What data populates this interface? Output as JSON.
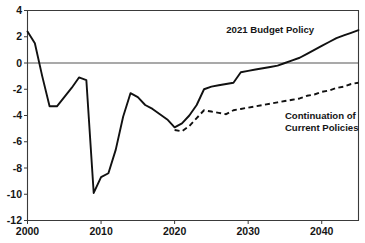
{
  "figure": {
    "partial_top_text": "",
    "background_color": "#ffffff",
    "line_color": "#111111"
  },
  "chart_data": {
    "type": "line",
    "title": "",
    "xlabel": "",
    "ylabel": "",
    "xlim": [
      2000,
      2045
    ],
    "ylim": [
      -12,
      4
    ],
    "yticks": [
      4,
      2,
      0,
      -2,
      -4,
      -6,
      -8,
      -10,
      -12
    ],
    "ytick_labels": [
      "4",
      "2",
      "0",
      "-2",
      "-4",
      "-6",
      "-8",
      "-10",
      "-12"
    ],
    "xticks": [
      2000,
      2010,
      2020,
      2030,
      2040
    ],
    "xtick_labels": [
      "2000",
      "2010",
      "2020",
      "2030",
      "2040"
    ],
    "grid": false,
    "legend_position": "inline-annotations",
    "zero_line": 0,
    "annotations": [
      {
        "text": "2021 Budget Policy",
        "x": 2033,
        "y": 2.3,
        "anchor": "middle"
      },
      {
        "text": "Continuation of",
        "x": 2035,
        "y": -4.3,
        "anchor": "start"
      },
      {
        "text": "Current Policies",
        "x": 2035,
        "y": -5.2,
        "anchor": "start"
      }
    ],
    "series": [
      {
        "name": "2021 Budget Policy",
        "style": "solid",
        "x": [
          2000,
          2001,
          2002,
          2003,
          2004,
          2005,
          2006,
          2007,
          2008,
          2009,
          2010,
          2011,
          2012,
          2013,
          2014,
          2015,
          2016,
          2017,
          2018,
          2019,
          2020,
          2021,
          2022,
          2023,
          2024,
          2025,
          2026,
          2027,
          2028,
          2029,
          2030,
          2031,
          2032,
          2033,
          2034,
          2035,
          2036,
          2037,
          2038,
          2039,
          2040,
          2041,
          2042,
          2043,
          2044,
          2045
        ],
        "values": [
          2.4,
          1.5,
          -1.0,
          -3.3,
          -3.3,
          -2.6,
          -1.9,
          -1.1,
          -1.3,
          -9.9,
          -8.7,
          -8.4,
          -6.6,
          -4.1,
          -2.3,
          -2.6,
          -3.2,
          -3.5,
          -3.9,
          -4.3,
          -4.9,
          -4.6,
          -4.0,
          -3.2,
          -2.0,
          -1.8,
          -1.7,
          -1.6,
          -1.5,
          -0.7,
          -0.6,
          -0.5,
          -0.4,
          -0.3,
          -0.2,
          0.0,
          0.2,
          0.4,
          0.7,
          1.0,
          1.3,
          1.6,
          1.9,
          2.1,
          2.3,
          2.5
        ]
      },
      {
        "name": "Continuation of Current Policies",
        "style": "dashed",
        "x": [
          2020,
          2021,
          2022,
          2023,
          2024,
          2025,
          2026,
          2027,
          2028,
          2029,
          2030,
          2031,
          2032,
          2033,
          2034,
          2035,
          2036,
          2037,
          2038,
          2039,
          2040,
          2041,
          2042,
          2043,
          2044,
          2045
        ],
        "values": [
          -5.1,
          -5.2,
          -4.8,
          -4.2,
          -3.6,
          -3.7,
          -3.8,
          -3.9,
          -3.6,
          -3.5,
          -3.4,
          -3.3,
          -3.2,
          -3.1,
          -3.0,
          -2.9,
          -2.8,
          -2.7,
          -2.5,
          -2.4,
          -2.2,
          -2.1,
          -1.9,
          -1.8,
          -1.6,
          -1.5
        ]
      }
    ]
  }
}
